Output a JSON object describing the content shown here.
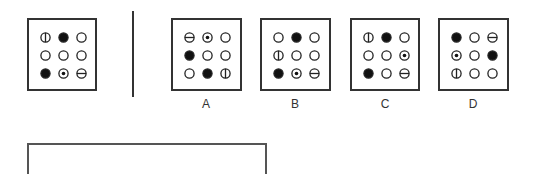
{
  "question": {
    "reference_grid": [
      [
        "vertical-split",
        "filled",
        "empty"
      ],
      [
        "empty",
        "empty",
        "empty"
      ],
      [
        "filled",
        "dot",
        "horizontal-split"
      ]
    ]
  },
  "options": [
    {
      "label": "A",
      "grid": [
        [
          "horizontal-split",
          "dot",
          "empty"
        ],
        [
          "filled",
          "empty",
          "empty"
        ],
        [
          "empty",
          "filled",
          "vertical-split"
        ]
      ]
    },
    {
      "label": "B",
      "grid": [
        [
          "empty",
          "filled",
          "empty"
        ],
        [
          "vertical-split",
          "empty",
          "empty"
        ],
        [
          "filled",
          "dot",
          "horizontal-split"
        ]
      ]
    },
    {
      "label": "C",
      "grid": [
        [
          "vertical-split",
          "filled",
          "empty"
        ],
        [
          "empty",
          "empty",
          "dot"
        ],
        [
          "filled",
          "empty",
          "horizontal-split"
        ]
      ]
    },
    {
      "label": "D",
      "grid": [
        [
          "filled",
          "empty",
          "horizontal-split"
        ],
        [
          "dot",
          "empty",
          "filled"
        ],
        [
          "vertical-split",
          "empty",
          "empty"
        ]
      ]
    }
  ],
  "colors": {
    "stroke": "#222222",
    "fill": "#111111",
    "background": "#ffffff"
  }
}
